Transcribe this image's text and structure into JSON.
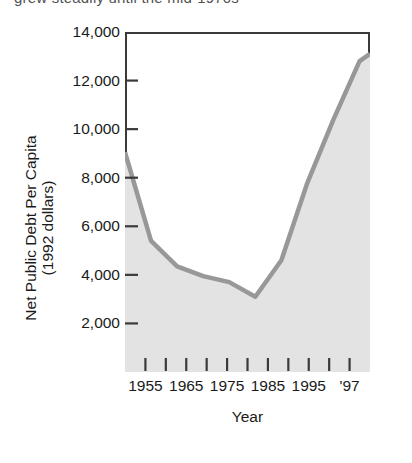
{
  "page": {
    "clipped_running_text": "grew steadily   until the mid-1970s"
  },
  "chart_data": {
    "type": "area",
    "title": "",
    "xlabel": "Year",
    "ylabel": "Net Public Debt Per Capita (1992 dollars)",
    "ylabel_line1": "Net Public Debt Per Capita",
    "ylabel_line2": "(1992 dollars)",
    "xlim": [
      1950,
      1997
    ],
    "ylim": [
      0,
      14000
    ],
    "grid": false,
    "legend": null,
    "y_ticks": [
      14000,
      12000,
      10000,
      8000,
      6000,
      4000,
      2000
    ],
    "y_tick_labels": [
      "14,000",
      "12,000",
      "10,000",
      "8,000",
      "6,000",
      "4,000",
      "2,000"
    ],
    "x_ticks": [
      1955,
      1960,
      1965,
      1970,
      1975,
      1980,
      1985,
      1990,
      1995,
      1996,
      1997
    ],
    "x_tick_count": 11,
    "x_tick_labels": [
      "1955",
      "1965",
      "1975",
      "1985",
      "1995",
      "'97"
    ],
    "x_labeled_values": [
      1955,
      1965,
      1975,
      1985,
      1995,
      1997
    ],
    "series": [
      {
        "name": "Net public debt per capita (1992 dollars)",
        "line_color": "#989898",
        "fill_color": "#e3e3e3",
        "x": [
          1950,
          1955,
          1960,
          1965,
          1970,
          1975,
          1980,
          1985,
          1990,
          1995,
          1997
        ],
        "values": [
          9050,
          5400,
          4350,
          3950,
          3700,
          3100,
          4600,
          7800,
          10400,
          12800,
          13100
        ]
      }
    ]
  }
}
